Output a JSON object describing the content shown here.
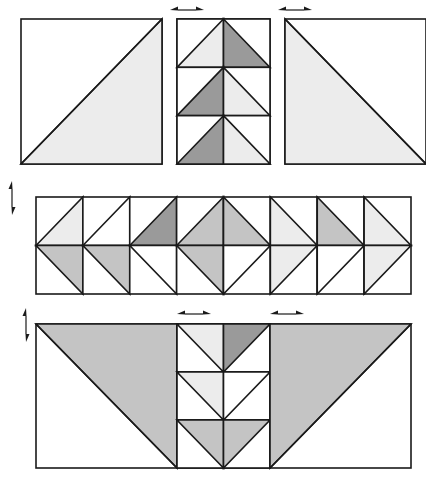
{
  "colors": {
    "white": "#ffffff",
    "light": "#ececec",
    "medium": "#c4c4c4",
    "dark": "#9a9a9a",
    "line": "#1a1a1a"
  },
  "rows": [
    {
      "name": "top-row",
      "units": [
        {
          "name": "top-left-half-square",
          "x": 21,
          "y": 19,
          "w": 141,
          "h": 145,
          "tris": [
            {
              "pts": "br,tr,bl",
              "fill": "light"
            }
          ]
        },
        {
          "name": "top-center-flying-geese-column",
          "x": 177,
          "y": 19,
          "w": 93,
          "h": 145,
          "geese": {
            "dir": "up",
            "count": 3,
            "fills": [
              [
                "light",
                "dark"
              ],
              [
                "dark",
                "light"
              ],
              [
                "dark",
                "light"
              ]
            ]
          }
        },
        {
          "name": "top-right-half-square",
          "x": 285,
          "y": 19,
          "w": 141,
          "h": 145,
          "tris": [
            {
              "pts": "tl,bl,br",
              "fill": "light"
            }
          ]
        }
      ]
    },
    {
      "name": "middle-row",
      "x": 36,
      "y": 197,
      "w": 375,
      "h": 97,
      "cols": 8,
      "cells": [
        {
          "top": {
            "type": "left",
            "fill": "light"
          },
          "bottom": {
            "type": "left",
            "fill": "medium"
          }
        },
        {
          "top": {
            "type": "left",
            "fill": "white"
          },
          "bottom": {
            "type": "left",
            "fill": "medium"
          }
        },
        {
          "top": {
            "type": "left",
            "fill": "dark"
          },
          "bottom": {
            "type": "left",
            "fill": "white"
          }
        },
        {
          "top": {
            "type": "diamond-left",
            "fill": "medium"
          },
          "bottom": {
            "type": "diamond-left",
            "fill": "medium"
          }
        },
        {
          "top": {
            "type": "diamond-right",
            "fill": "medium"
          },
          "bottom": {
            "type": "diamond-right",
            "fill": "white"
          }
        },
        {
          "top": {
            "type": "right",
            "fill": "light"
          },
          "bottom": {
            "type": "right",
            "fill": "light"
          }
        },
        {
          "top": {
            "type": "right",
            "fill": "medium"
          },
          "bottom": {
            "type": "right",
            "fill": "white"
          }
        },
        {
          "top": {
            "type": "right",
            "fill": "light"
          },
          "bottom": {
            "type": "right",
            "fill": "light"
          }
        }
      ]
    },
    {
      "name": "bottom-row",
      "units": [
        {
          "name": "bottom-left-half-square",
          "x": 36,
          "y": 324,
          "w": 141,
          "h": 144,
          "tris": [
            {
              "pts": "tl,tr,br",
              "fill": "medium"
            }
          ]
        },
        {
          "name": "bottom-center-flying-geese-column",
          "x": 177,
          "y": 324,
          "w": 93,
          "h": 144,
          "geese": {
            "dir": "down",
            "count": 3,
            "fills": [
              [
                "light",
                "dark"
              ],
              [
                "light",
                "white"
              ],
              [
                "medium",
                "medium"
              ]
            ]
          }
        },
        {
          "name": "bottom-right-half-square",
          "x": 270,
          "y": 324,
          "w": 141,
          "h": 144,
          "tris": [
            {
              "pts": "tl,tr,bl",
              "fill": "medium"
            }
          ]
        }
      ]
    }
  ],
  "arrows": [
    {
      "name": "press-arrow-top-left",
      "orient": "h",
      "x": 170,
      "y": 10,
      "len": 34
    },
    {
      "name": "press-arrow-top-right",
      "orient": "h",
      "x": 278,
      "y": 10,
      "len": 34
    },
    {
      "name": "press-arrow-side-upper",
      "orient": "v",
      "x": 12,
      "y": 181,
      "len": 34
    },
    {
      "name": "press-arrow-side-lower",
      "orient": "v",
      "x": 26,
      "y": 308,
      "len": 34
    },
    {
      "name": "press-arrow-bottom-left",
      "orient": "h",
      "x": 177,
      "y": 314,
      "len": 34
    },
    {
      "name": "press-arrow-bottom-right",
      "orient": "h",
      "x": 270,
      "y": 314,
      "len": 34
    }
  ]
}
